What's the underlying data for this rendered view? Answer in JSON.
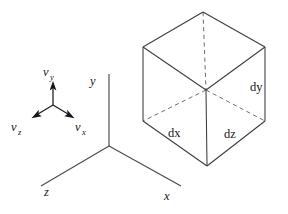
{
  "figure": {
    "background_color": "#ffffff",
    "line_color": "#3b3b42",
    "dashed_color": "#6d6d74",
    "vector_color": "#16161a",
    "text_color": "#17171b"
  },
  "axes": {
    "labels": {
      "y": "y",
      "x": "x",
      "z": "z"
    },
    "origin": {
      "x": 109,
      "y": 146
    },
    "endpoints": {
      "y_tip": {
        "x": 109,
        "y": 74
      },
      "x_tip": {
        "x": 181,
        "y": 186
      },
      "z_tip": {
        "x": 41,
        "y": 186
      }
    }
  },
  "vector_triad": {
    "origin": {
      "x": 53,
      "y": 105
    },
    "labels": {
      "vy_base": "v",
      "vy_sub": "y",
      "vx_base": "v",
      "vx_sub": "x",
      "vz_base": "v",
      "vz_sub": "z"
    },
    "arrows": [
      {
        "name": "vy",
        "tip": {
          "x": 53,
          "y": 84
        }
      },
      {
        "name": "vx",
        "tip": {
          "x": 72,
          "y": 117
        }
      },
      {
        "name": "vz",
        "tip": {
          "x": 34,
          "y": 117
        }
      }
    ]
  },
  "cube": {
    "dimension_labels": {
      "dx": "dx",
      "dy": "dy",
      "dz": "dz"
    },
    "vertices": {
      "top": {
        "x": 203,
        "y": 12
      },
      "upper_left": {
        "x": 143,
        "y": 47
      },
      "upper_right": {
        "x": 265,
        "y": 47
      },
      "center": {
        "x": 206,
        "y": 90
      },
      "lower_left": {
        "x": 143,
        "y": 121
      },
      "lower_right": {
        "x": 265,
        "y": 121
      },
      "bottom": {
        "x": 207,
        "y": 166
      }
    },
    "hidden_edge_style": "dashed",
    "visible_edge_style": "solid"
  }
}
